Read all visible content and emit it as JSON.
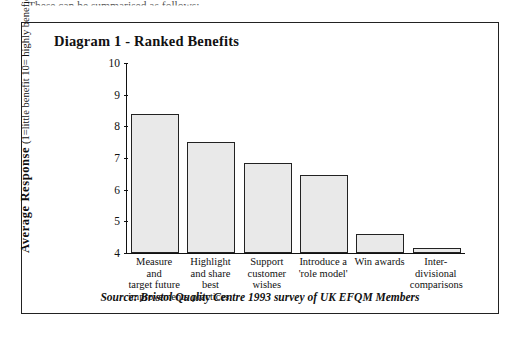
{
  "page": {
    "above_text": "These can be summarised as follows:"
  },
  "figure": {
    "title": "Diagram 1 - Ranked Benefits",
    "source_note": "Source: Bristol Quality Centre 1993 survey of UK EFQM Members"
  },
  "chart_data": {
    "type": "bar",
    "title": "Diagram 1 - Ranked Benefits",
    "xlabel": "",
    "ylabel": "Average Response (1=little benefit  10= highly beneficial)",
    "ylabel_main": "Average Response",
    "ylabel_sub": "(1=little benefit  10= highly beneficial)",
    "categories": [
      "Measure and target future improvements",
      "Highlight and share best practices",
      "Support customer wishes",
      "Introduce a 'role model'",
      "Win awards",
      "Inter-divisional comparisons"
    ],
    "category_lines": [
      [
        "Measure and",
        "target future",
        "improvements"
      ],
      [
        "Highlight",
        "and share",
        "best practices"
      ],
      [
        "Support",
        "customer",
        "wishes"
      ],
      [
        "Introduce a",
        "'role model'"
      ],
      [
        "Win awards"
      ],
      [
        "Inter-",
        "divisional",
        "comparisons"
      ]
    ],
    "values": [
      8.4,
      7.5,
      6.85,
      6.45,
      4.6,
      4.15
    ],
    "ylim": [
      4,
      10
    ],
    "yticks": [
      4,
      5,
      6,
      7,
      8,
      9,
      10
    ],
    "ytick_labels": [
      "4",
      "5",
      "6",
      "7",
      "8",
      "9",
      "10"
    ],
    "grid": false,
    "legend": false,
    "bar_color": "#e9e9e9",
    "bar_edge_color": "#222222"
  }
}
